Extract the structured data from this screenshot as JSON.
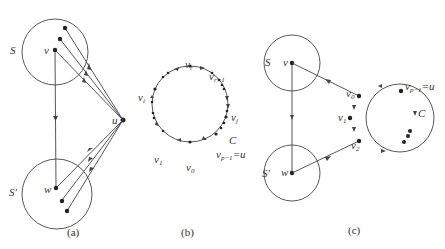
{
  "figure": {
    "panels": [
      {
        "id": "a",
        "caption": "(a)",
        "sets": [
          {
            "label": "S",
            "vertex": "v"
          },
          {
            "label": "S'",
            "vertex": "w"
          }
        ],
        "hub_vertex": "u"
      },
      {
        "id": "b",
        "caption": "(b)",
        "cycle_label": "C",
        "vertices": [
          "v_r",
          "v_{r+1}",
          "v_j",
          "v_{p-1}=u",
          "v_0",
          "v_1",
          "v_i"
        ]
      },
      {
        "id": "c",
        "caption": "(c)",
        "sets": [
          {
            "label": "S",
            "vertex": "v"
          },
          {
            "label": "S'",
            "vertex": "w"
          }
        ],
        "cycle_label": "C",
        "vertices": [
          "v_0",
          "v_1",
          "v_2",
          "v_{p-1}=u"
        ]
      }
    ]
  },
  "labels": {
    "a": {
      "S": "S",
      "Sp": "S'",
      "v": "v",
      "w": "w",
      "u": "u",
      "cap": "(a)"
    },
    "b": {
      "vr_main": "v",
      "vr_sub": "r",
      "vr1_main": "v",
      "vr1_sub": "r+1",
      "vj_main": "v",
      "vj_sub": "j",
      "C": "C",
      "vp_main": "v",
      "vp_sub": "p−1",
      "vp_eq": "=u",
      "v0_main": "v",
      "v0_sub": "0",
      "v1_main": "v",
      "v1_sub": "1",
      "vi_main": "v",
      "vi_sub": "i",
      "cap": "(b)"
    },
    "c": {
      "S": "S",
      "Sp": "S'",
      "v": "v",
      "w": "w",
      "v0_main": "v",
      "v0_sub": "0",
      "v1_main": "v",
      "v1_sub": "1",
      "v2_main": "v",
      "v2_sub": "2",
      "vp_main": "v",
      "vp_sub": "p−1",
      "vp_eq": "=u",
      "C": "C",
      "cap": "(c)"
    }
  }
}
